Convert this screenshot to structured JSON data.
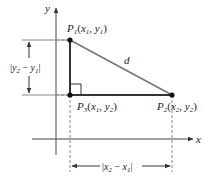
{
  "diagram": {
    "axes": {
      "x_label": "x",
      "y_label": "y"
    },
    "points": [
      {
        "id": "P1",
        "name": "P",
        "sub": "1",
        "coords": [
          "x",
          "1",
          "y",
          "1"
        ]
      },
      {
        "id": "P2",
        "name": "P",
        "sub": "2",
        "coords": [
          "x",
          "2",
          "y",
          "2"
        ]
      },
      {
        "id": "P3",
        "name": "P",
        "sub": "3",
        "coords": [
          "x",
          "1",
          "y",
          "2"
        ]
      }
    ],
    "hypotenuse_label": "d",
    "vertical_distance_label": {
      "a": "y",
      "a_sub": "2",
      "op": " − ",
      "b": "y",
      "b_sub": "1"
    },
    "horizontal_distance_label": {
      "a": "x",
      "a_sub": "2",
      "op": " − ",
      "b": "x",
      "b_sub": "1"
    },
    "colors": {
      "triangle_side": "#333333",
      "hypotenuse": "#777777",
      "axis": "#333333",
      "guide": "#888888"
    }
  }
}
